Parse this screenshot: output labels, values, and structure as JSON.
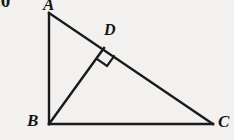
{
  "figure": {
    "kind": "geometry-diagram",
    "background_color": "#f2f1ef",
    "stroke_color": "#1a1a1a",
    "canvas": {
      "width": 234,
      "height": 140
    },
    "corner_fragment": ".0",
    "vertices": [
      {
        "id": "A",
        "label": "A",
        "x": 49,
        "y": 13
      },
      {
        "id": "B",
        "label": "B",
        "x": 49,
        "y": 124
      },
      {
        "id": "C",
        "label": "C",
        "x": 213,
        "y": 124
      },
      {
        "id": "D",
        "label": "D",
        "x": 104,
        "y": 48
      }
    ],
    "segments": [
      {
        "name": "AB",
        "from": "A",
        "to": "B"
      },
      {
        "name": "BC",
        "from": "B",
        "to": "C"
      },
      {
        "name": "AC",
        "from": "A",
        "to": "C"
      },
      {
        "name": "BD",
        "from": "B",
        "to": "D"
      }
    ],
    "right_angle_marks": [
      {
        "name": "right-angle-at-D",
        "at": "D",
        "size": 13
      }
    ]
  }
}
